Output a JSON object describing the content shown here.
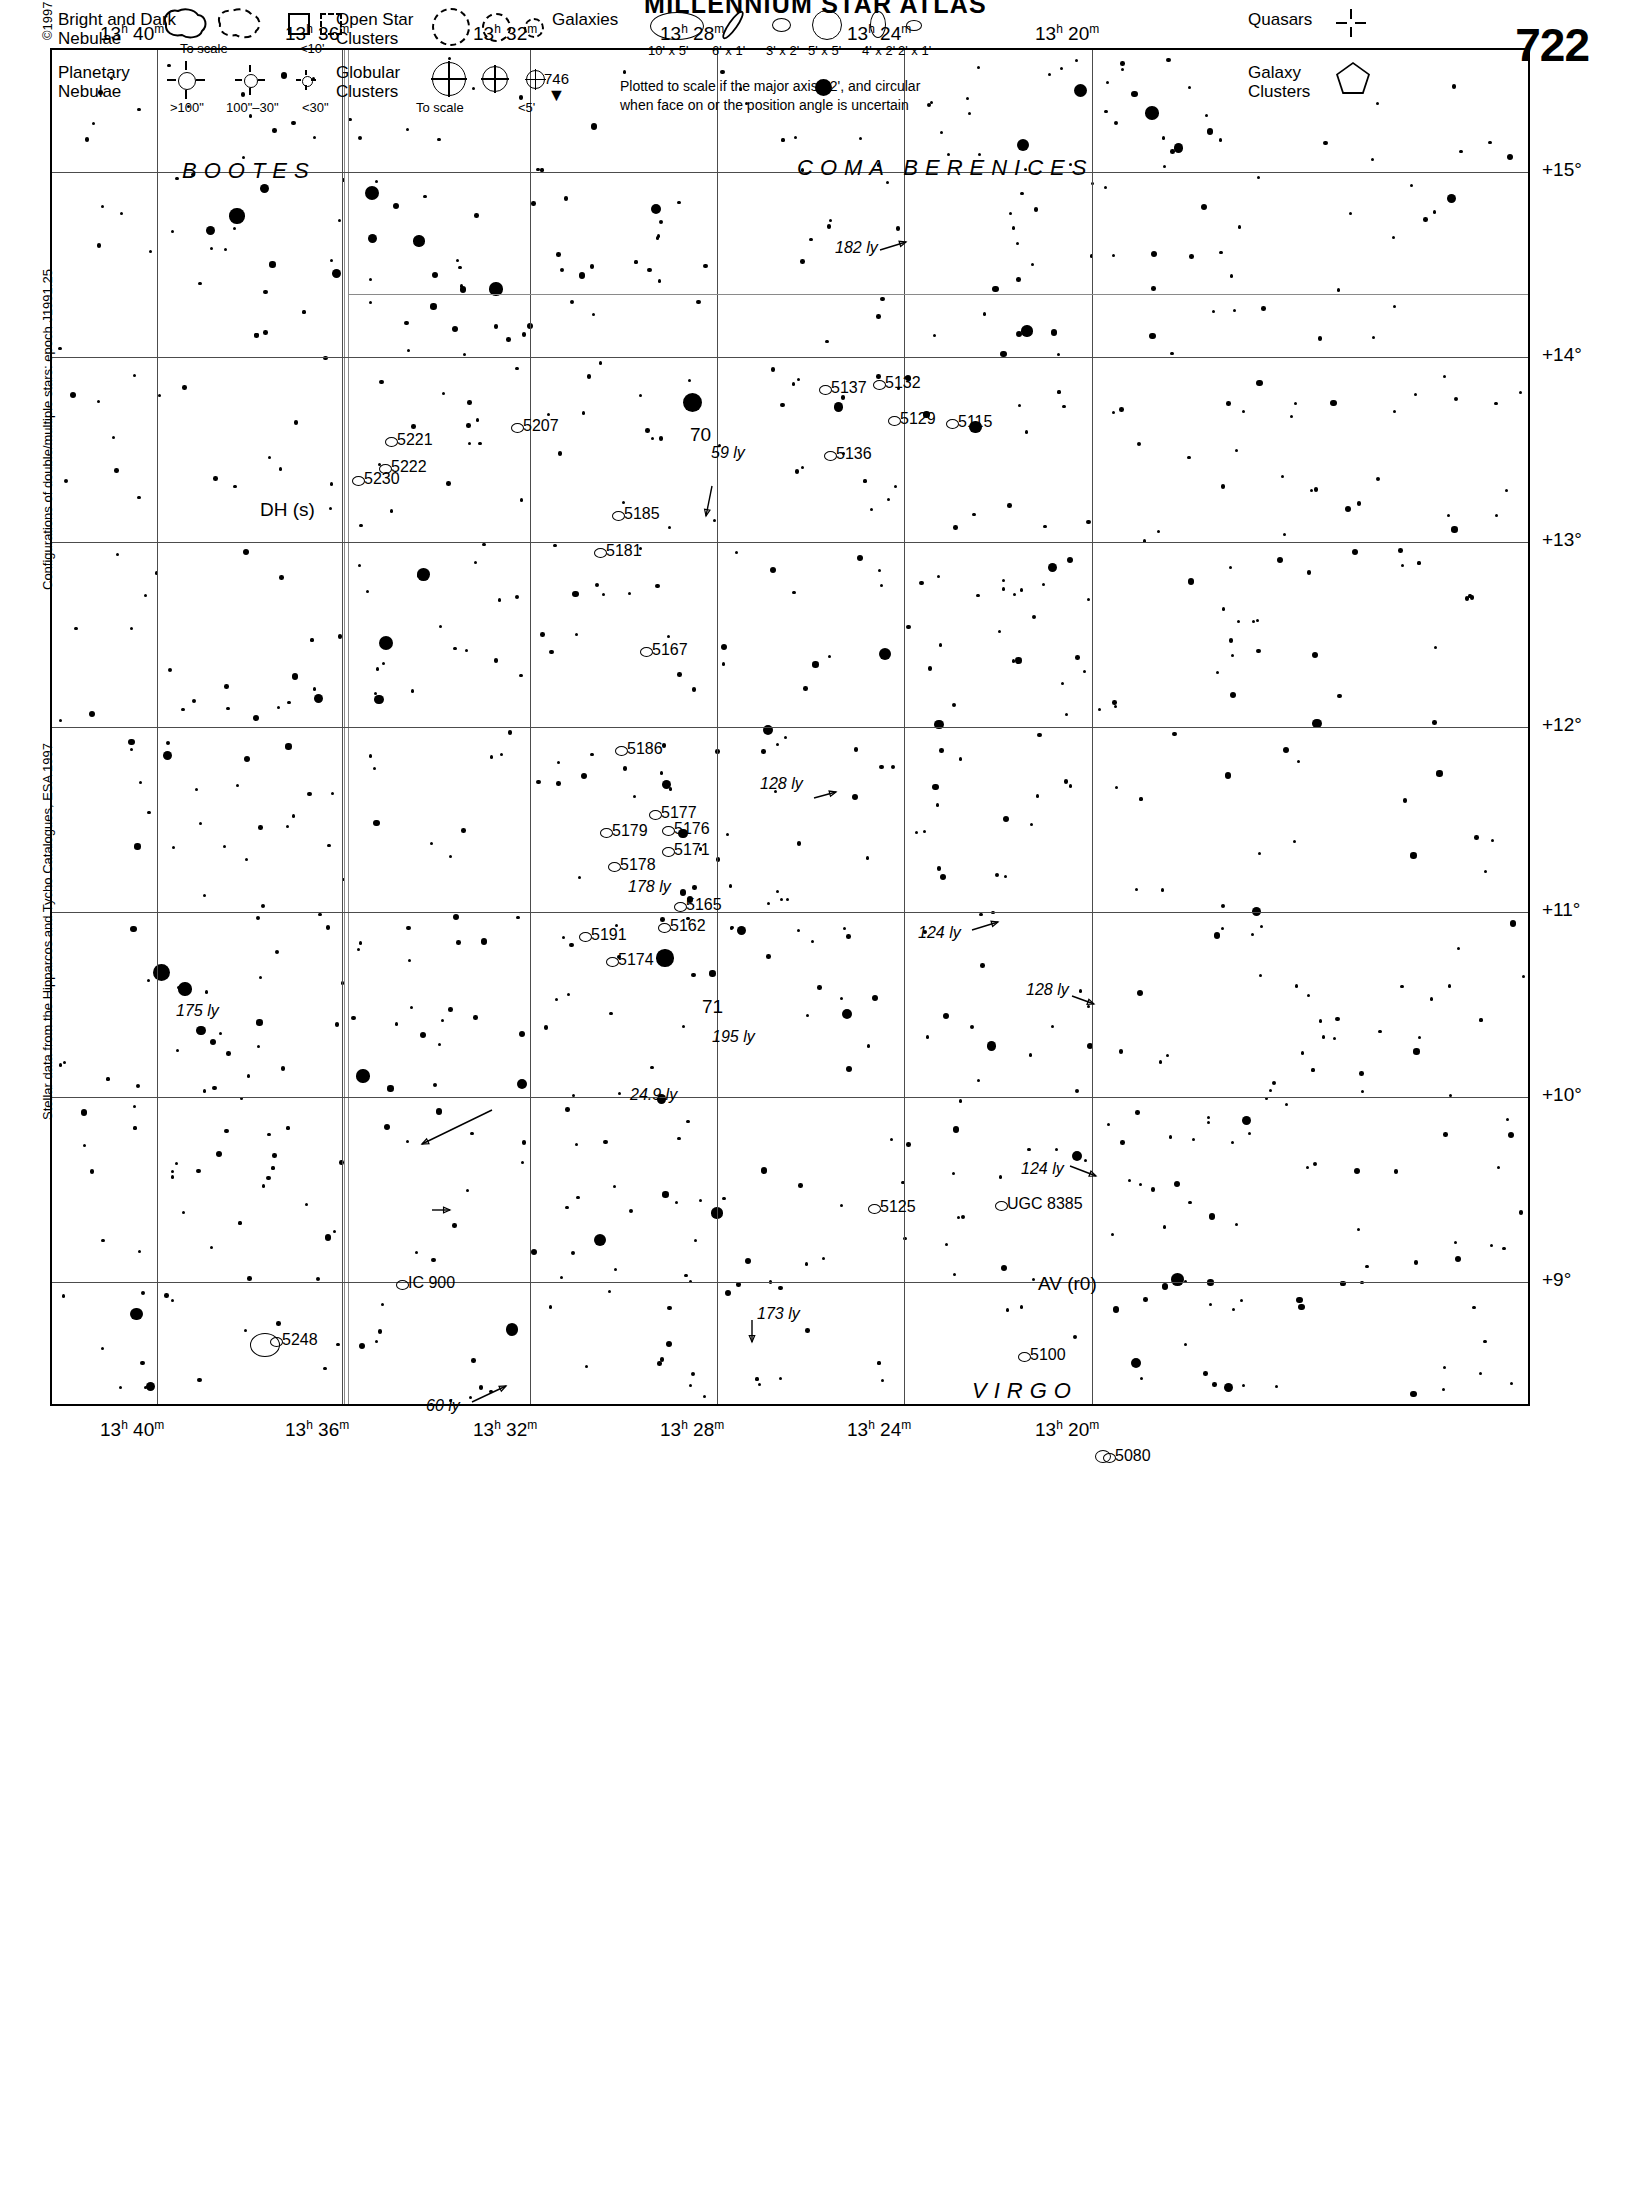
{
  "title": "MILLENNIUM STAR ATLAS",
  "page_number": "722",
  "chart_data": {
    "type": "scatter",
    "title": "MILLENNIUM STAR ATLAS",
    "xlabel": "Right Ascension",
    "ylabel": "Declination",
    "xlim": [
      "13h 42m",
      "13h 19m"
    ],
    "ylim": [
      "+8.7°",
      "+15.6°"
    ],
    "grid": true,
    "ra_ticks": [
      "13h 40m",
      "13h 36m",
      "13h 32m",
      "13h 28m",
      "13h 24m",
      "13h 20m"
    ],
    "dec_ticks": [
      "+15°",
      "+14°",
      "+13°",
      "+12°",
      "+11°",
      "+10°",
      "+9°"
    ],
    "constellations": [
      "BOOTES",
      "COMA BERENICES",
      "VIRGO"
    ],
    "deep_sky_labels": [
      "5221",
      "5222",
      "5230",
      "5207",
      "5137",
      "5132",
      "5129",
      "5115",
      "5136",
      "5185",
      "5181",
      "5167",
      "5186",
      "5177",
      "5176",
      "5179",
      "5171",
      "5178",
      "5165",
      "5162",
      "5191",
      "5174",
      "5125",
      "UGC 8385",
      "5100",
      "5080",
      "5248",
      "IC 900"
    ],
    "named_stars": [
      "70",
      "71",
      "DH (s)",
      "AV (r0)"
    ],
    "distance_annotations": [
      "182 ly",
      "59 ly",
      "128 ly",
      "178 ly",
      "124 ly",
      "175 ly",
      "128 ly",
      "195 ly",
      "24.9 ly",
      "124 ly",
      "173 ly",
      "60 ly"
    ]
  },
  "header": {
    "ra_labels": [
      {
        "text": "13",
        "sup_h": "h",
        "min": "40",
        "sup_m": "m"
      },
      {
        "text": "13",
        "sup_h": "h",
        "min": "36",
        "sup_m": "m"
      },
      {
        "text": "13",
        "sup_h": "h",
        "min": "32",
        "sup_m": "m"
      },
      {
        "text": "13",
        "sup_h": "h",
        "min": "28",
        "sup_m": "m"
      },
      {
        "text": "13",
        "sup_h": "h",
        "min": "24",
        "sup_m": "m"
      },
      {
        "text": "13",
        "sup_h": "h",
        "min": "20",
        "sup_m": "m"
      }
    ]
  },
  "ra_top": [
    "13h 40m",
    "13h 36m",
    "13h 32m",
    "13h 28m",
    "13h 24m",
    "13h 20m"
  ],
  "ra_bottom": [
    "13h 40m",
    "13h 36m",
    "13h 32m",
    "13h 28m",
    "13h 24m",
    "13h 20m"
  ],
  "dec_labels": [
    "+15°",
    "+14°",
    "+13°",
    "+12°",
    "+11°",
    "+10°",
    "+9°"
  ],
  "side_notes": {
    "copyright": "©1997 Sky Publishing Corporation",
    "doubles": "Configurations of double/multiple stars: epoch J1991.25",
    "hipparcos": "Stellar data from the Hipparcos and Tycho Catalogues, ESA 1997"
  },
  "constellations": [
    {
      "name": "BOOTES",
      "x": 130,
      "y": 108
    },
    {
      "name": "COMA BERENICES",
      "x": 745,
      "y": 105
    },
    {
      "name": "VIRGO",
      "x": 920,
      "y": 1328
    }
  ],
  "objects": [
    {
      "label": "5221",
      "x": 345,
      "y": 391
    },
    {
      "label": "5222",
      "x": 339,
      "y": 418
    },
    {
      "label": "5230",
      "x": 312,
      "y": 430
    },
    {
      "label": "5207",
      "x": 471,
      "y": 377
    },
    {
      "label": "5137",
      "x": 779,
      "y": 339
    },
    {
      "label": "5132",
      "x": 833,
      "y": 334
    },
    {
      "label": "5129",
      "x": 848,
      "y": 370
    },
    {
      "label": "5115",
      "x": 906,
      "y": 373
    },
    {
      "label": "5136",
      "x": 784,
      "y": 405
    },
    {
      "label": "5185",
      "x": 572,
      "y": 465
    },
    {
      "label": "5181",
      "x": 554,
      "y": 502
    },
    {
      "label": "5167",
      "x": 600,
      "y": 601
    },
    {
      "label": "5186",
      "x": 575,
      "y": 700
    },
    {
      "label": "5177",
      "x": 609,
      "y": 764
    },
    {
      "label": "5176",
      "x": 622,
      "y": 780
    },
    {
      "label": "5179",
      "x": 560,
      "y": 782
    },
    {
      "label": "5171",
      "x": 622,
      "y": 801
    },
    {
      "label": "5178",
      "x": 568,
      "y": 816
    },
    {
      "label": "5165",
      "x": 634,
      "y": 856
    },
    {
      "label": "5162",
      "x": 618,
      "y": 877
    },
    {
      "label": "5191",
      "x": 539,
      "y": 886
    },
    {
      "label": "5174",
      "x": 566,
      "y": 911
    },
    {
      "label": "5125",
      "x": 828,
      "y": 1158
    },
    {
      "label": "UGC 8385",
      "x": 955,
      "y": 1155
    },
    {
      "label": "5100",
      "x": 978,
      "y": 1306
    },
    {
      "label": "5080",
      "x": 1063,
      "y": 1407
    },
    {
      "label": "5248",
      "x": 230,
      "y": 1291
    },
    {
      "label": "IC 900",
      "x": 356,
      "y": 1234
    }
  ],
  "star_labels": [
    {
      "label": "70",
      "x": 638,
      "y": 385
    },
    {
      "label": "71",
      "x": 650,
      "y": 957
    },
    {
      "label": "DH (s)",
      "x": 208,
      "y": 460
    },
    {
      "label": "AV (r0)",
      "x": 986,
      "y": 1234
    }
  ],
  "distances": [
    {
      "label": "182 ly",
      "x": 783,
      "y": 199
    },
    {
      "label": "59 ly",
      "x": 659,
      "y": 404
    },
    {
      "label": "128 ly",
      "x": 708,
      "y": 735
    },
    {
      "label": "178 ly",
      "x": 576,
      "y": 838
    },
    {
      "label": "124 ly",
      "x": 866,
      "y": 884
    },
    {
      "label": "175 ly",
      "x": 124,
      "y": 962
    },
    {
      "label": "128 ly",
      "x": 974,
      "y": 941
    },
    {
      "label": "195 ly",
      "x": 660,
      "y": 988
    },
    {
      "label": "24.9 ly",
      "x": 578,
      "y": 1046
    },
    {
      "label": "124 ly",
      "x": 969,
      "y": 1120
    },
    {
      "label": "173 ly",
      "x": 705,
      "y": 1265
    },
    {
      "label": "60 ly",
      "x": 374,
      "y": 1357
    }
  ],
  "legend": {
    "nebulae_bright_dark": "Bright and Dark\nNebulae",
    "nebulae_bright_dark_l1": "Bright and Dark",
    "nebulae_bright_dark_l2": "Nebulae",
    "nebulae_to_scale": "To scale",
    "nebulae_lt10": "<10'",
    "planetary_l1": "Planetary",
    "planetary_l2": "Nebulae",
    "planetary_gt100": ">100\"",
    "planetary_100_30": "100\"–30\"",
    "planetary_lt30": "<30\"",
    "open_l1": "Open Star",
    "open_l2": "Clusters",
    "globular_l1": "Globular",
    "globular_l2": "Clusters",
    "globular_to_scale": "To scale",
    "globular_lt5": "<5'",
    "galaxies": "Galaxies",
    "gal_sizes": [
      "10' x 5'",
      "6' x 1'",
      "3' x 2'",
      "5' x 5'",
      "4' x 2'",
      "2' x 1'"
    ],
    "gal_note_l1": "Plotted to scale if the major axis >2', and circular",
    "gal_note_l2": "when face on or the position angle is uncertain",
    "quasars": "Quasars",
    "galaxy_clusters_l1": "Galaxy",
    "galaxy_clusters_l2": "Clusters",
    "adjacent_page": "746"
  }
}
